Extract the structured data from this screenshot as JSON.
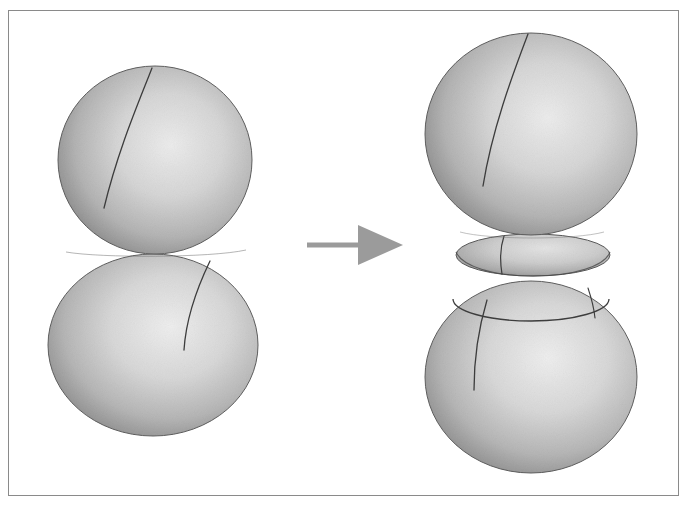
{
  "figure": {
    "title": "Two tangent spheres transformed into a neck-separated pair",
    "background_color": "#ffffff",
    "frame": {
      "name": "figure-border",
      "x": 8,
      "y": 10,
      "width": 671,
      "height": 486,
      "stroke_color": "#8a8a8a",
      "stroke_width": 1
    },
    "arrow": {
      "label": "",
      "name": "transformation-arrow",
      "color": "#9b9b9b",
      "x1": 307,
      "y1": 245,
      "x2": 400,
      "y2": 245,
      "shaft_width": 5,
      "head_length": 14,
      "head_width": 16
    },
    "surface_shading": {
      "rim_color": "#6e6e6e",
      "mid_color": "#b8b8b8",
      "highlight_color": "#ebebeb",
      "edge_outline_color": "#5a5a5a",
      "meridian_color": "#3d3d3d",
      "latitude_color": "#3d3d3d"
    },
    "left_group": {
      "name": "tangent-spheres-before",
      "caption": "",
      "shapes": [
        {
          "name": "upper-sphere",
          "type": "sphere",
          "cx": 155,
          "cy": 160,
          "rx": 97,
          "ry": 94,
          "highlight_cx_pct": 58,
          "highlight_cy_pct": 42,
          "meridian": "M152,68 C138,104 118,150 104,208"
        },
        {
          "name": "lower-sphere",
          "type": "sphere",
          "cx": 153,
          "cy": 345,
          "rx": 105,
          "ry": 91,
          "highlight_cx_pct": 58,
          "highlight_cy_pct": 40,
          "meridian": "M210,261 C196,290 186,318 184,350"
        }
      ],
      "tangency": {
        "name": "tangency-point",
        "x": 155,
        "y": 254,
        "description": "spheres meet at a single tangent point"
      }
    },
    "right_group": {
      "name": "neck-separated-spheres-after",
      "caption": "",
      "shapes": [
        {
          "name": "upper-sphere",
          "type": "sphere",
          "cx": 531,
          "cy": 134,
          "rx": 106,
          "ry": 101,
          "highlight_cx_pct": 58,
          "highlight_cy_pct": 42,
          "meridian": "M528,34 C512,76 492,130 483,186"
        },
        {
          "name": "middle-neck-lens",
          "type": "lens",
          "cx": 533,
          "cy": 255,
          "rx": 77,
          "ry": 21,
          "highlight_cx_pct": 58,
          "highlight_cy_pct": 38,
          "meridian": "M504,236 C500,248 500,262 502,274"
        },
        {
          "name": "lower-sphere",
          "type": "sphere",
          "cx": 531,
          "cy": 377,
          "rx": 106,
          "ry": 96,
          "highlight_cx_pct": 58,
          "highlight_cy_pct": 40,
          "meridian": "M487,300 C478,330 474,356 474,390",
          "latitude_ring": {
            "name": "latitude-circle",
            "cx": 531,
            "cy": 299,
            "rx": 78,
            "ry": 22
          }
        }
      ]
    }
  },
  "chart_data": {
    "type": "diagram",
    "title": "Two tangent spheres transformed into a neck-separated pair",
    "panels": [
      {
        "name": "left-panel",
        "label": "before",
        "objects": [
          "upper sphere",
          "lower sphere"
        ],
        "relation": "tangent at one point"
      },
      {
        "name": "right-panel",
        "label": "after",
        "objects": [
          "upper sphere",
          "middle lens neck",
          "lower sphere"
        ],
        "relation": "separated by a lens-shaped neck region"
      }
    ],
    "connector": "rightwards arrow"
  }
}
